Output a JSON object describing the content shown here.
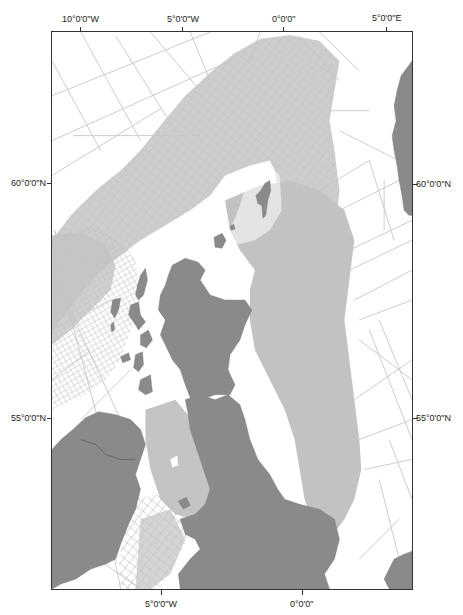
{
  "map": {
    "type": "survey-coverage-map",
    "region": "British Isles and North Sea",
    "colors": {
      "land": "#8a8a8a",
      "survey_lines": "#c4c4c4",
      "survey_dense": "#bdbdbd",
      "sea": "#ffffff",
      "frame": "#333333"
    },
    "axes": {
      "top_ticks": [
        {
          "label": "10°0'0\"W",
          "x": 81
        },
        {
          "label": "5°0'0\"W",
          "x": 183
        },
        {
          "label": "0°0'0\"",
          "x": 284
        },
        {
          "label": "5°0'0\"E",
          "x": 386
        }
      ],
      "bottom_ticks": [
        {
          "label": "5°0'0\"W",
          "x": 161
        },
        {
          "label": "0°0'0\"",
          "x": 302
        }
      ],
      "left_ticks": [
        {
          "label": "60°0'0\"N",
          "y": 183
        },
        {
          "label": "55°0'0\"N",
          "y": 418
        }
      ],
      "right_ticks": [
        {
          "label": "60°0'0\"N",
          "y": 184
        },
        {
          "label": "55°0'0\"N",
          "y": 418
        }
      ]
    }
  }
}
